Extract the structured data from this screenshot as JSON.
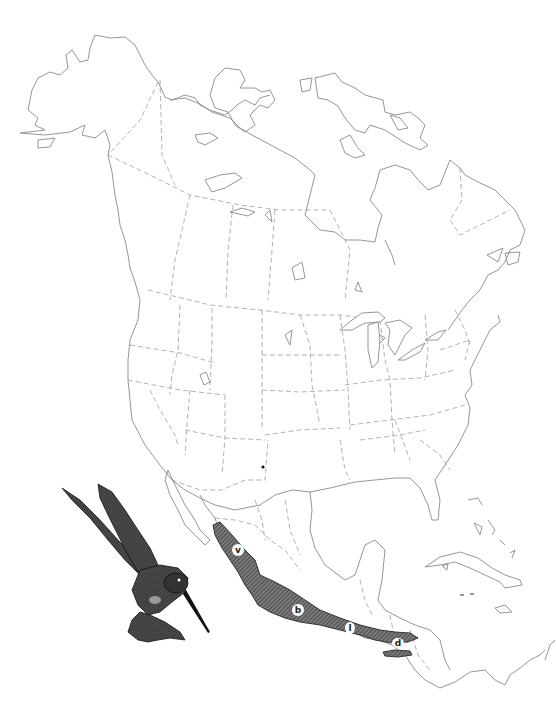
{
  "map": {
    "title": "Range map of North America",
    "region": "North America",
    "range_color": "#5a5a5a",
    "coast_color": "#8a8a8a",
    "border_color": "#a0a0a0",
    "range_labels": [
      {
        "id": "v",
        "text": "v"
      },
      {
        "id": "b",
        "text": "b"
      },
      {
        "id": "l",
        "text": "l"
      },
      {
        "id": "d",
        "text": "d"
      }
    ],
    "locality_marker": "dot"
  },
  "illustration": {
    "subject": "hummingbird",
    "icon": "hummingbird-icon"
  }
}
